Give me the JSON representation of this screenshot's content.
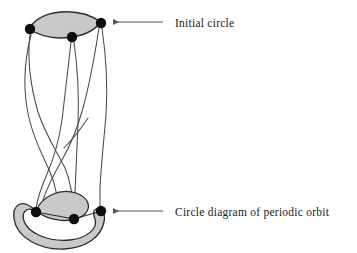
{
  "figure": {
    "title_visible": false,
    "background_color": "#ffffff",
    "stroke_color": "#3c3c3c",
    "dark_outline_color": "#2b2b2b",
    "fill_gray": "#c9c9c9",
    "dot_color": "#0d0d0d",
    "arrow_color": "#555555",
    "text_color": "#1a1a1a"
  },
  "labels": [
    {
      "id": "initial-circle",
      "text": "Initial circle",
      "x": 175,
      "y": 27,
      "arrow": {
        "x1": 163,
        "y1": 22,
        "x2": 112,
        "y2": 22
      }
    },
    {
      "id": "periodic-orbit",
      "text": "Circle diagram of periodic orbit",
      "x": 175,
      "y": 216,
      "arrow": {
        "x1": 163,
        "y1": 211,
        "x2": 112,
        "y2": 211
      }
    }
  ],
  "top_circle": {
    "name": "Initial circle",
    "shape": "lens",
    "fill": "#c9c9c9",
    "points": [
      {
        "id": "top-left-point",
        "cx": 30,
        "cy": 29,
        "r": 5.2
      },
      {
        "id": "top-middle-point",
        "cx": 72,
        "cy": 37,
        "r": 5.2
      },
      {
        "id": "top-right-point",
        "cx": 101,
        "cy": 23,
        "r": 5.2
      }
    ]
  },
  "bottom_band": {
    "name": "Circle diagram of periodic orbit",
    "shape": "twisted-band",
    "fill": "#c9c9c9",
    "points": [
      {
        "id": "bottom-left-point",
        "cx": 36,
        "cy": 212,
        "r": 5.2
      },
      {
        "id": "bottom-middle-point",
        "cx": 74,
        "cy": 219,
        "r": 5.2
      },
      {
        "id": "bottom-right-point",
        "cx": 101,
        "cy": 211,
        "r": 5.2
      }
    ]
  },
  "strands": {
    "count": 3,
    "description": "Three braided strands connecting the initial circle to the periodic orbit band",
    "crossings": 2
  }
}
